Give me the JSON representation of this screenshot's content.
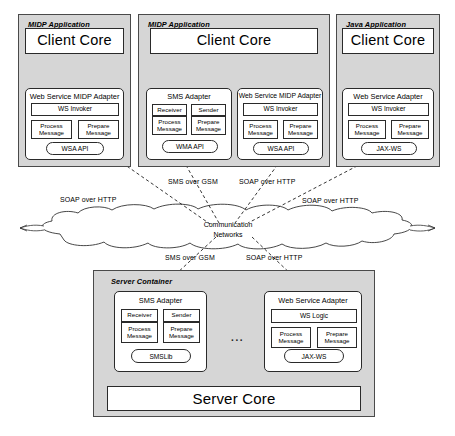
{
  "diagram": {
    "colors": {
      "panel_fill": "#d6d6d6",
      "box_fill": "#ffffff",
      "stroke": "#2a2a2a",
      "panel_stroke": "#4a4a4a"
    }
  },
  "clients": [
    {
      "id": "midp-app-1",
      "title": "MIDP Application",
      "core": "Client Core",
      "adapters": [
        {
          "id": "ws-midp-adapter-1",
          "title": "Web Service MIDP Adapter",
          "logic": "WS Invoker",
          "process": "Process Message",
          "prepare": "Prepare Message",
          "api": "WSA API",
          "stacked": false
        }
      ]
    },
    {
      "id": "midp-app-2",
      "title": "MIDP Application",
      "core": "Client Core",
      "adapters": [
        {
          "id": "sms-adapter-client",
          "title": "SMS Adapter",
          "receiver": "Receiver",
          "sender": "Sender",
          "process": "Process Message",
          "prepare": "Prepare Message",
          "api": "WMA API",
          "stacked": true
        },
        {
          "id": "ws-midp-adapter-2",
          "title": "Web Service MIDP Adapter",
          "logic": "WS Invoker",
          "process": "Process Message",
          "prepare": "Prepare Message",
          "api": "WSA API",
          "stacked": false
        }
      ]
    },
    {
      "id": "java-app",
      "title": "Java Application",
      "core": "Client Core",
      "adapters": [
        {
          "id": "ws-adapter-java",
          "title": "Web Service Adapter",
          "logic": "WS Invoker",
          "process": "Process Message",
          "prepare": "Prepare Message",
          "api": "JAX-WS",
          "stacked": false
        }
      ]
    }
  ],
  "network": {
    "cloud_line1": "Communication",
    "cloud_line2": "Networks",
    "upper_labels": [
      {
        "id": "soap-left",
        "text": "SOAP over HTTP"
      },
      {
        "id": "sms-gsm-upper",
        "text": "SMS over GSM"
      },
      {
        "id": "soap-mid",
        "text": "SOAP over HTTP"
      },
      {
        "id": "soap-right",
        "text": "SOAP over HTTP"
      }
    ],
    "lower_labels": [
      {
        "id": "sms-gsm-lower",
        "text": "SMS over GSM"
      },
      {
        "id": "soap-lower",
        "text": "SOAP over HTTP"
      }
    ]
  },
  "server": {
    "title": "Server Container",
    "core": "Server Core",
    "ellipsis": "...",
    "adapters": [
      {
        "id": "sms-adapter-server",
        "title": "SMS Adapter",
        "receiver": "Receiver",
        "sender": "Sender",
        "process": "Process Message",
        "prepare": "Prepare Message",
        "api": "SMSLib",
        "stacked": true
      },
      {
        "id": "ws-adapter-server",
        "title": "Web Service  Adapter",
        "logic": "WS Logic",
        "process": "Process Message",
        "prepare": "Prepare Message",
        "api": "JAX-WS",
        "stacked": false
      }
    ]
  }
}
